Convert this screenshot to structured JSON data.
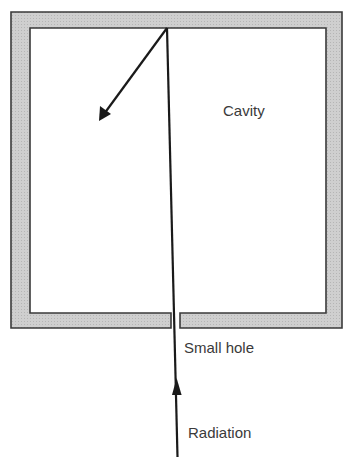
{
  "diagram": {
    "labels": {
      "cavity": "Cavity",
      "hole": "Small hole",
      "radiation": "Radiation"
    },
    "colors": {
      "wall_fill": "#c8c8c8",
      "wall_stroke": "#3a3a3a",
      "ray": "#1a1a1a",
      "text": "#3a3a3a"
    },
    "elements": [
      {
        "id": "cavity-wall",
        "type": "box-with-gap",
        "outer": [
          11,
          12,
          342,
          328
        ],
        "inner": [
          30,
          28,
          326,
          313
        ],
        "gap_x": [
          171,
          180
        ]
      },
      {
        "id": "incident-ray",
        "type": "arrow",
        "from": [
          177,
          457
        ],
        "to": [
          167,
          28
        ],
        "arrowhead_at": [
          177,
          383
        ]
      },
      {
        "id": "reflected-ray",
        "type": "arrow",
        "from": [
          167,
          28
        ],
        "to": [
          99,
          121
        ]
      }
    ]
  }
}
